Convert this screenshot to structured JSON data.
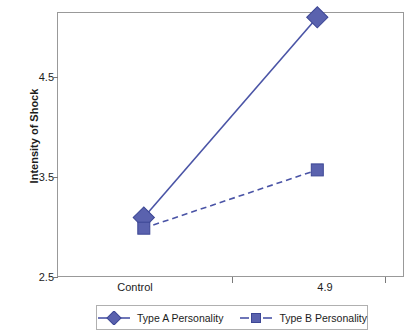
{
  "chart_data": {
    "type": "line",
    "title": "",
    "xlabel": "",
    "ylabel": "Intensity of Shock",
    "categories": [
      "Control",
      "4.9"
    ],
    "ylim": [
      2.5,
      5.0
    ],
    "yticks": [
      "2.5",
      "3.5",
      "4.5"
    ],
    "ytick_values": [
      2.5,
      3.5,
      4.5
    ],
    "grid": false,
    "legend_position": "bottom",
    "series": [
      {
        "name": "Type A Personality",
        "values": [
          3.06,
          4.95
        ],
        "marker": "diamond",
        "linestyle": "solid",
        "color": "#4A54A6"
      },
      {
        "name": "Type B Personality",
        "values": [
          2.96,
          3.51
        ],
        "marker": "square",
        "linestyle": "dashed",
        "color": "#4A54A6"
      }
    ]
  },
  "axis": {
    "y_title": "Intensity of Shock",
    "y_tick_labels": [
      "4.5",
      "3.5",
      "2.5"
    ],
    "x_tick_labels": [
      "Control",
      "4.9"
    ]
  },
  "legend": {
    "entries": [
      {
        "label": "Type A Personality",
        "marker": "diamond",
        "linestyle": "solid"
      },
      {
        "label": "Type B Personality",
        "marker": "square",
        "linestyle": "dashed"
      }
    ]
  },
  "colors": {
    "series": "#4A54A6",
    "marker_fill": "#5A62AE",
    "frame": "#999999",
    "text": "#1c1c1c",
    "background": "#ffffff"
  }
}
